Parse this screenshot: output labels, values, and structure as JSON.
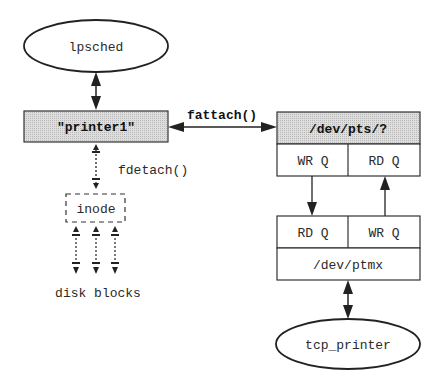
{
  "diagram": {
    "nodes": {
      "lpsched": {
        "label": "lpsched",
        "shape": "ellipse"
      },
      "printer1": {
        "label": "\"printer1\"",
        "shape": "shaded-box"
      },
      "inode": {
        "label": "inode",
        "shape": "dashed-box"
      },
      "disk_blocks": {
        "label": "disk blocks"
      },
      "dev_pts": {
        "label": "/dev/pts/?",
        "shape": "shaded-box"
      },
      "pts_wrq": {
        "label": "WR Q"
      },
      "pts_rdq": {
        "label": "RD Q"
      },
      "ptmx_rdq": {
        "label": "RD Q"
      },
      "ptmx_wrq": {
        "label": "WR Q"
      },
      "dev_ptmx": {
        "label": "/dev/ptmx"
      },
      "tcp_printer": {
        "label": "tcp_printer",
        "shape": "ellipse"
      }
    },
    "edges": {
      "fattach": {
        "label": "fattach()",
        "from": "printer1",
        "to": "dev_pts",
        "style": "bidirectional"
      },
      "fdetach": {
        "label": "fdetach()",
        "from": "printer1",
        "to": "inode",
        "style": "dotted-bidirectional"
      },
      "lpsched_printer1": {
        "from": "lpsched",
        "to": "printer1",
        "style": "bidirectional"
      },
      "inode_disk": {
        "from": "inode",
        "to": "disk_blocks",
        "style": "dotted-bidirectional",
        "count": 3
      },
      "pts_to_ptmx": {
        "from": "pts_wrq",
        "to": "ptmx_rdq",
        "style": "arrow-down"
      },
      "ptmx_to_pts": {
        "from": "ptmx_wrq",
        "to": "pts_rdq",
        "style": "arrow-up"
      },
      "ptmx_tcp": {
        "from": "dev_ptmx",
        "to": "tcp_printer",
        "style": "bidirectional"
      }
    },
    "colors": {
      "stroke": "#333333",
      "shade": "#d4d4d4",
      "text": "#2a2a2a"
    }
  }
}
